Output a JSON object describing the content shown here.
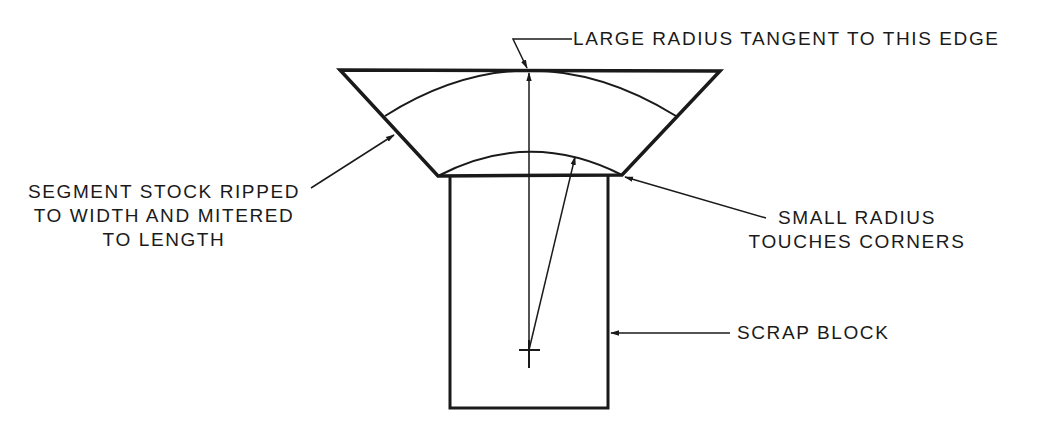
{
  "diagram": {
    "colors": {
      "ink": "#1a1a1a",
      "background": "#ffffff"
    },
    "labels": {
      "large_radius": "LARGE RADIUS TANGENT TO THIS EDGE",
      "segment_stock": [
        "SEGMENT STOCK RIPPED",
        "TO WIDTH AND MITERED",
        "TO LENGTH"
      ],
      "small_radius": [
        "SMALL RADIUS",
        "TOUCHES CORNERS"
      ],
      "scrap_block": "SCRAP BLOCK"
    },
    "shapes": {
      "segment": "trapezoid",
      "block": "rectangle",
      "center_mark": "cross",
      "arcs": [
        "large-radius-arc",
        "small-radius-arc"
      ]
    }
  }
}
